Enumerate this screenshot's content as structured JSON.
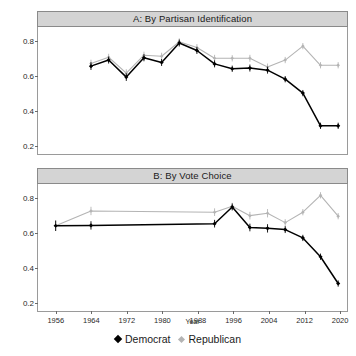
{
  "figure": {
    "xaxis_title": "Year"
  },
  "legend": {
    "items": [
      {
        "label": "Democrat",
        "key": "diamond-dark",
        "color": "#000000"
      },
      {
        "label": "Republican",
        "key": "diamond-light",
        "color": "#b4b4b4"
      }
    ]
  },
  "panels": {
    "a": {
      "title": "A: By Partisan Identification"
    },
    "b": {
      "title": "B: By Vote Choice"
    }
  },
  "chart_data": [
    {
      "type": "line",
      "id": "panel-a",
      "title": "A: By Partisan Identification",
      "xlabel": "Year",
      "ylabel": "",
      "xlim": [
        1952,
        2022
      ],
      "ylim": [
        0.15,
        0.88
      ],
      "grid": false,
      "legend_position": "bottom",
      "xticks": [
        1956,
        1964,
        1972,
        1980,
        1988,
        1996,
        2004,
        2012,
        2020
      ],
      "yticks": [
        0.2,
        0.4,
        0.6,
        0.8
      ],
      "error_bars": true,
      "series": [
        {
          "name": "Democrat",
          "color": "#000000",
          "x": [
            1964,
            1968,
            1972,
            1976,
            1980,
            1984,
            1988,
            1992,
            1996,
            2000,
            2004,
            2008,
            2012,
            2016,
            2020
          ],
          "values": [
            0.655,
            0.69,
            0.592,
            0.703,
            0.676,
            0.788,
            0.745,
            0.668,
            0.64,
            0.644,
            0.632,
            0.58,
            0.5,
            0.312,
            0.312
          ],
          "errors": [
            0.022,
            0.02,
            0.022,
            0.02,
            0.02,
            0.02,
            0.02,
            0.02,
            0.018,
            0.02,
            0.02,
            0.018,
            0.018,
            0.018,
            0.018
          ]
        },
        {
          "name": "Republican",
          "color": "#b4b4b4",
          "x": [
            1964,
            1968,
            1972,
            1976,
            1980,
            1984,
            1988,
            1992,
            1996,
            2000,
            2004,
            2008,
            2012,
            2016,
            2020
          ],
          "values": [
            0.67,
            0.706,
            0.615,
            0.718,
            0.712,
            0.795,
            0.762,
            0.7,
            0.7,
            0.7,
            0.65,
            0.69,
            0.77,
            0.66,
            0.66
          ],
          "errors": [
            0.022,
            0.02,
            0.022,
            0.02,
            0.02,
            0.02,
            0.02,
            0.02,
            0.018,
            0.02,
            0.02,
            0.018,
            0.018,
            0.018,
            0.018
          ]
        }
      ]
    },
    {
      "type": "line",
      "id": "panel-b",
      "title": "B: By Vote Choice",
      "xlabel": "Year",
      "ylabel": "",
      "xlim": [
        1952,
        2022
      ],
      "ylim": [
        0.15,
        0.88
      ],
      "grid": false,
      "legend_position": "bottom",
      "xticks": [
        1956,
        1964,
        1972,
        1980,
        1988,
        1996,
        2004,
        2012,
        2020
      ],
      "yticks": [
        0.2,
        0.4,
        0.6,
        0.8
      ],
      "error_bars": true,
      "series": [
        {
          "name": "Democrat",
          "color": "#000000",
          "x": [
            1956,
            1964,
            1992,
            1996,
            2000,
            2004,
            2008,
            2012,
            2016,
            2020
          ],
          "values": [
            0.64,
            0.642,
            0.652,
            0.748,
            0.63,
            0.625,
            0.618,
            0.57,
            0.462,
            0.308
          ],
          "errors": [
            0.03,
            0.024,
            0.022,
            0.02,
            0.022,
            0.024,
            0.02,
            0.018,
            0.018,
            0.018
          ]
        },
        {
          "name": "Republican",
          "color": "#b4b4b4",
          "x": [
            1956,
            1964,
            1992,
            1996,
            2000,
            2004,
            2008,
            2012,
            2016,
            2020
          ],
          "values": [
            0.64,
            0.725,
            0.718,
            0.752,
            0.698,
            0.712,
            0.658,
            0.718,
            0.815,
            0.695
          ],
          "errors": [
            0.03,
            0.024,
            0.022,
            0.02,
            0.022,
            0.024,
            0.02,
            0.018,
            0.018,
            0.018
          ]
        }
      ]
    }
  ]
}
